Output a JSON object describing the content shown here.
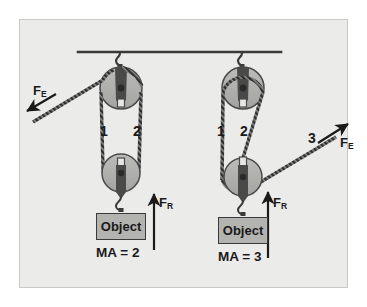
{
  "figure": {
    "background_color": "#ebebe9",
    "page_color": "#ffffff",
    "border_color": "#c9c9c5",
    "ink_color": "#3a3a3a",
    "pulley_fill": "#b0b0ad",
    "object_fill": "#b3b3b0",
    "rope_color": "#2e2e2e"
  },
  "ceiling": {
    "name": "ceiling-support-bar"
  },
  "systems": [
    {
      "id": "left",
      "mechanical_advantage_label": "MA = 2",
      "object_label": "Object",
      "effort_force_label": "F",
      "effort_force_sub": "E",
      "resistance_force_label": "F",
      "resistance_force_sub": "R",
      "rope_segments": [
        "1",
        "2"
      ],
      "effort_direction": "down-left",
      "supporting_ropes": 2
    },
    {
      "id": "right",
      "mechanical_advantage_label": "MA = 3",
      "object_label": "Object",
      "effort_force_label": "F",
      "effort_force_sub": "E",
      "resistance_force_label": "F",
      "resistance_force_sub": "R",
      "rope_segments": [
        "1",
        "2",
        "3"
      ],
      "effort_direction": "up-right",
      "supporting_ropes": 3
    }
  ]
}
